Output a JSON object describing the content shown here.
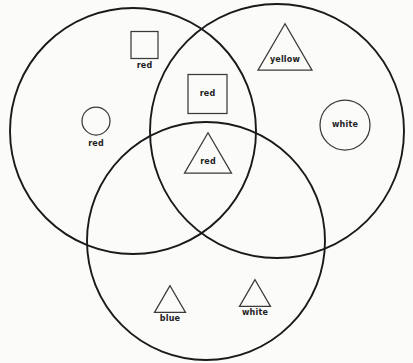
{
  "diagram": {
    "type": "venn-diagram",
    "title": "",
    "background_color": "#fbfbfa",
    "stroke_color": "#1a1a1a",
    "sets": [
      {
        "name": "left-circle",
        "cx": 133,
        "cy": 131,
        "r": 123
      },
      {
        "name": "right-circle",
        "cx": 277,
        "cy": 131,
        "r": 127
      },
      {
        "name": "bottom-circle",
        "cx": 206,
        "cy": 241,
        "r": 119
      }
    ],
    "items": [
      {
        "id": "square-red-left",
        "shape": "square",
        "label": "red",
        "region": "left-only",
        "label_position": "below",
        "x": 144.5,
        "y": 45,
        "size": 27,
        "label_x": 144.5,
        "label_y": 66
      },
      {
        "id": "circle-red-left",
        "shape": "circle",
        "label": "red",
        "region": "left-only",
        "label_position": "below",
        "x": 96,
        "y": 121,
        "size": 28,
        "label_x": 96,
        "label_y": 144
      },
      {
        "id": "triangle-yellow-right",
        "shape": "triangle",
        "label": "yellow",
        "region": "right-only",
        "label_position": "inside",
        "x": 285,
        "y": 47,
        "size": 54,
        "label_x": 285,
        "label_y": 60
      },
      {
        "id": "circle-white-right",
        "shape": "circle",
        "label": "white",
        "region": "right-only",
        "label_position": "inside",
        "x": 345,
        "y": 125,
        "size": 50,
        "label_x": 345,
        "label_y": 125
      },
      {
        "id": "square-red-center-top",
        "shape": "square",
        "label": "red",
        "region": "left-right",
        "label_position": "inside",
        "x": 207.5,
        "y": 94,
        "size": 39,
        "label_x": 207.5,
        "label_y": 94
      },
      {
        "id": "triangle-red-center",
        "shape": "triangle",
        "label": "red",
        "region": "all-three",
        "label_position": "inside",
        "x": 208,
        "y": 153,
        "size": 47,
        "label_x": 208,
        "label_y": 162
      },
      {
        "id": "triangle-blue-bottom",
        "shape": "triangle",
        "label": "blue",
        "region": "bottom-only",
        "label_position": "below",
        "x": 170,
        "y": 299,
        "size": 31,
        "label_x": 170,
        "label_y": 319
      },
      {
        "id": "triangle-white-bottom",
        "shape": "triangle",
        "label": "white",
        "region": "bottom-only",
        "label_position": "below",
        "x": 255,
        "y": 293,
        "size": 31,
        "label_x": 255,
        "label_y": 313
      }
    ]
  }
}
